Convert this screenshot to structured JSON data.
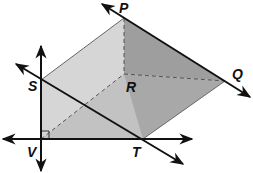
{
  "diagram": {
    "type": "geometry-prism-with-lines",
    "colors": {
      "light_face": "#d6d6d6",
      "mid_face": "#c4c4c4",
      "dark_face": "#9e9e9e",
      "line": "#111111",
      "dashed": "#555555",
      "background": "#ffffff"
    },
    "points": {
      "P": {
        "label": "P",
        "x": 124,
        "y": 18
      },
      "Q": {
        "label": "Q",
        "x": 225,
        "y": 81
      },
      "R": {
        "label": "R",
        "x": 124,
        "y": 74
      },
      "S": {
        "label": "S",
        "x": 41,
        "y": 80
      },
      "T": {
        "label": "T",
        "x": 143,
        "y": 139
      },
      "V": {
        "label": "V",
        "x": 41,
        "y": 139
      }
    },
    "labels": {
      "P": "P",
      "Q": "Q",
      "R": "R",
      "S": "S",
      "T": "T",
      "V": "V"
    },
    "lines": [
      {
        "name": "line-PQ",
        "through": [
          "P",
          "Q"
        ],
        "arrows": "both"
      },
      {
        "name": "line-ST",
        "through": [
          "S",
          "T"
        ],
        "arrows": "both"
      },
      {
        "name": "line-SV",
        "through": [
          "S",
          "V"
        ],
        "arrows": "both"
      },
      {
        "name": "line-VT",
        "through": [
          "V",
          "T"
        ],
        "arrows": "both"
      }
    ],
    "hidden_edges": [
      {
        "from": "P",
        "to": "R"
      },
      {
        "from": "R",
        "to": "Q"
      },
      {
        "from": "V",
        "to": "R"
      }
    ],
    "right_angle_marker": "V"
  }
}
